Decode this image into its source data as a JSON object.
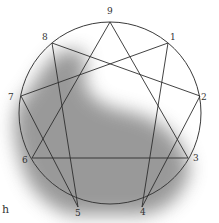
{
  "diagram": {
    "points": [
      {
        "label": "9",
        "x": 110,
        "y": 22,
        "lx": 107,
        "ly": 6
      },
      {
        "label": "1",
        "x": 168,
        "y": 43,
        "lx": 170,
        "ly": 32
      },
      {
        "label": "2",
        "x": 200,
        "y": 96,
        "lx": 201,
        "ly": 92
      },
      {
        "label": "3",
        "x": 188,
        "y": 158,
        "lx": 193,
        "ly": 153
      },
      {
        "label": "4",
        "x": 142,
        "y": 207,
        "lx": 140,
        "ly": 207
      },
      {
        "label": "5",
        "x": 78,
        "y": 207,
        "lx": 75,
        "ly": 208
      },
      {
        "label": "6",
        "x": 32,
        "y": 158,
        "lx": 22,
        "ly": 155
      },
      {
        "label": "7",
        "x": 21,
        "y": 96,
        "lx": 8,
        "ly": 92
      },
      {
        "label": "8",
        "x": 52,
        "y": 43,
        "lx": 42,
        "ly": 32
      }
    ],
    "triangle": [
      "9",
      "3",
      "6"
    ],
    "hexad": [
      "1",
      "4",
      "2",
      "8",
      "5",
      "7"
    ],
    "stray_text": "h",
    "colors": {
      "line": "#3a3a3a",
      "shadow": "#6d6d6d"
    }
  }
}
